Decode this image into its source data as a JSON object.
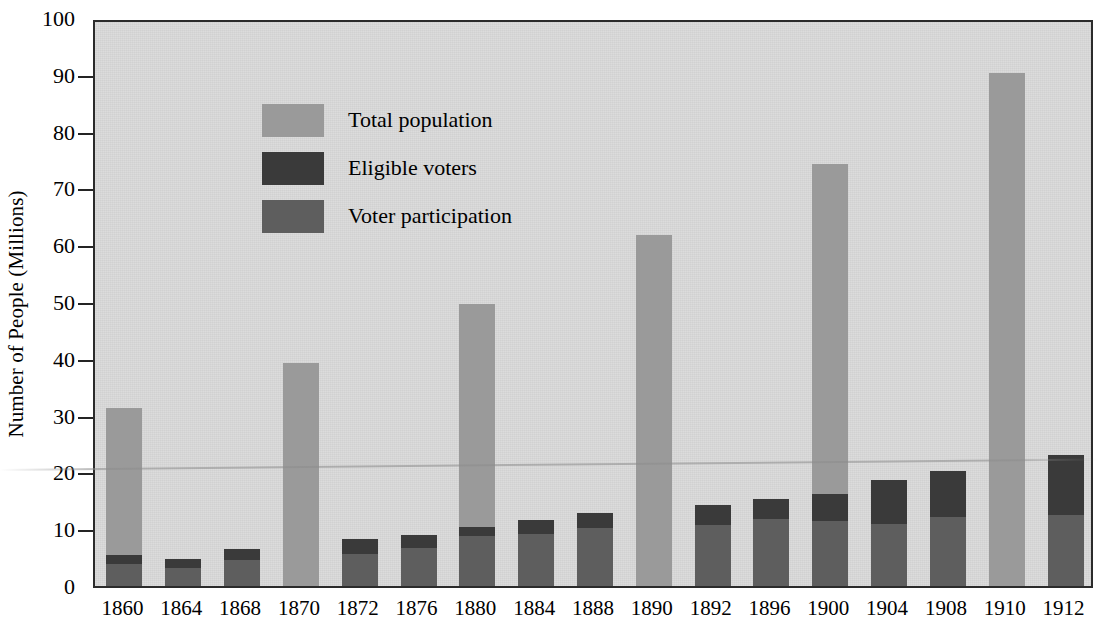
{
  "chart_data": {
    "type": "bar",
    "stacked": true,
    "title": "",
    "xlabel": "",
    "ylabel": "Number of People (Millions)",
    "ylim": [
      0,
      100
    ],
    "yticks": [
      0,
      10,
      20,
      30,
      40,
      50,
      60,
      70,
      80,
      90,
      100
    ],
    "grid": false,
    "legend_position": "upper-left",
    "categories": [
      "1860",
      "1864",
      "1868",
      "1870",
      "1872",
      "1876",
      "1880",
      "1884",
      "1888",
      "1890",
      "1892",
      "1896",
      "1900",
      "1904",
      "1908",
      "1910",
      "1912"
    ],
    "series": [
      {
        "name": "Voter participation",
        "color": "#5e5e5e",
        "values": [
          3.8,
          3.2,
          4.6,
          0,
          5.6,
          6.7,
          8.8,
          9.2,
          10.2,
          0,
          10.8,
          11.8,
          11.5,
          11.0,
          12.1,
          0,
          12.5
        ]
      },
      {
        "name": "Eligible voters",
        "color": "#3a3a3a",
        "values": [
          5.4,
          4.7,
          6.6,
          0,
          8.2,
          9.0,
          10.4,
          11.7,
          12.9,
          0,
          14.2,
          15.4,
          16.2,
          18.6,
          20.3,
          0,
          23.0
        ]
      },
      {
        "name": "Total population",
        "color": "#9a9a9a",
        "values": [
          31.4,
          0,
          0,
          39.2,
          0,
          0,
          49.6,
          0,
          0,
          61.8,
          0,
          0,
          74.3,
          0,
          0,
          90.3,
          0
        ]
      }
    ]
  },
  "legend": {
    "items": [
      {
        "label": "Total population",
        "color": "#9a9a9a"
      },
      {
        "label": "Eligible voters",
        "color": "#3a3a3a"
      },
      {
        "label": "Voter participation",
        "color": "#5e5e5e"
      }
    ]
  },
  "axes": {
    "y_title": "Number of People (Millions)",
    "y_tick_labels": [
      "0",
      "10",
      "20",
      "30",
      "40",
      "50",
      "60",
      "70",
      "80",
      "90",
      "100"
    ],
    "x_tick_labels": [
      "1860",
      "1864",
      "1868",
      "1870",
      "1872",
      "1876",
      "1880",
      "1884",
      "1888",
      "1890",
      "1892",
      "1896",
      "1900",
      "1904",
      "1908",
      "1910",
      "1912"
    ]
  },
  "colors": {
    "plot_background": "#d9d9d9",
    "frame": "#2b2b2b",
    "total_population": "#9a9a9a",
    "eligible_voters": "#3a3a3a",
    "voter_participation": "#5e5e5e"
  }
}
